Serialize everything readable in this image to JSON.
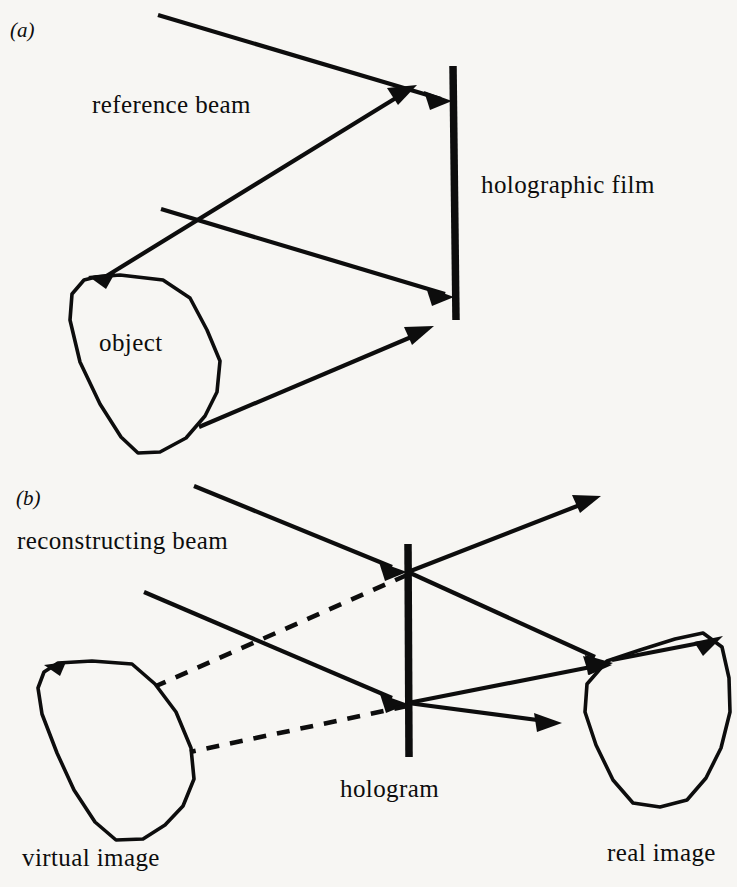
{
  "figure": {
    "background_color": "#f7f6f3",
    "ink_color": "#0d0d0d",
    "width": 737,
    "height": 887
  },
  "panels": [
    {
      "tag": "(a)",
      "name": "recording",
      "labels": {
        "reference_beam": "reference beam",
        "holographic_film": "holographic film",
        "object": "object"
      },
      "elements": {
        "plate_label": "holographic film",
        "plate_orientation": "vertical",
        "beams": [
          "reference beam incident on film from upper left",
          "beam from upper right reflected down-left onto object",
          "object beam from object top to film",
          "object beam from object bottom to film"
        ]
      }
    },
    {
      "tag": "(b)",
      "name": "reconstruction",
      "labels": {
        "reconstructing_beam": "reconstructing beam",
        "hologram": "hologram",
        "virtual_image": "virtual image",
        "real_image": "real image"
      },
      "elements": {
        "plate_label": "hologram",
        "plate_orientation": "vertical",
        "beams": [
          "reconstructing beam incident on hologram from upper left",
          "second reconstructing beam incident on hologram from left",
          "transmitted beam exiting upper right",
          "diffracted beams converging to real image",
          "dashed virtual rays traced back to virtual image"
        ]
      }
    }
  ]
}
